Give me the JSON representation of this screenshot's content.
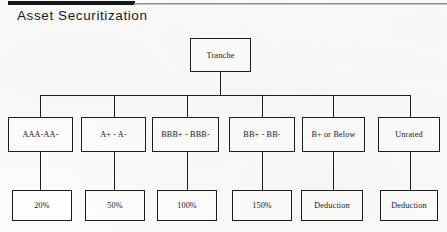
{
  "page": {
    "title": "Asset Securitization",
    "background_color": "#fbfbfa",
    "line_color": "#1d1e22"
  },
  "diagram": {
    "type": "hierarchy-tree",
    "root": {
      "label": "Tranche"
    },
    "columns": [
      {
        "rating": "AAA-AA-",
        "weight": "20%"
      },
      {
        "rating": "A+ - A-",
        "weight": "50%"
      },
      {
        "rating": "BBB+ - BBB-",
        "weight": "100%"
      },
      {
        "rating": "BB+ - BB-",
        "weight": "150%"
      },
      {
        "rating": "B+ or Below",
        "weight": "Deduction"
      },
      {
        "rating": "Unrated",
        "weight": "Deduction"
      }
    ]
  }
}
